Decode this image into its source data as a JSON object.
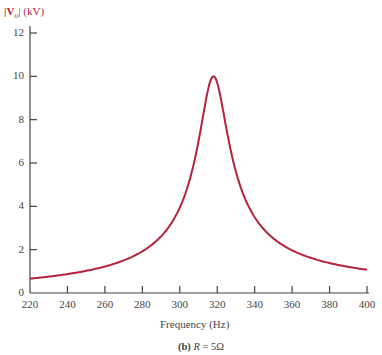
{
  "chart_data": {
    "type": "line",
    "title": "",
    "caption_prefix": "(b)",
    "caption_var": "R",
    "caption_rest": " = 5Ω",
    "xlabel": "Frequency (Hz)",
    "ylabel_main": "|V",
    "ylabel_sub": "o",
    "ylabel_rest": "| (kV)",
    "xlim": [
      220,
      400
    ],
    "ylim": [
      0,
      12
    ],
    "x_ticks": [
      "220",
      "240",
      "260",
      "280",
      "300",
      "320",
      "340",
      "360",
      "380",
      "400"
    ],
    "y_ticks": [
      "0",
      "2",
      "4",
      "6",
      "8",
      "10",
      "12"
    ],
    "grid": false,
    "line_color": "#b5223a",
    "series": [
      {
        "name": "|Vo| (kV)",
        "x": [
          220,
          240,
          260,
          280,
          290,
          300,
          305,
          310,
          314,
          318,
          322,
          326,
          330,
          340,
          350,
          360,
          380,
          400
        ],
        "values": [
          0.64,
          0.86,
          1.2,
          1.9,
          2.6,
          4.0,
          5.3,
          7.3,
          9.0,
          10.0,
          9.3,
          7.6,
          5.9,
          3.5,
          2.5,
          1.95,
          1.4,
          1.15
        ]
      }
    ],
    "model": {
      "peak": 10,
      "f0": 318,
      "Q": 20
    }
  }
}
